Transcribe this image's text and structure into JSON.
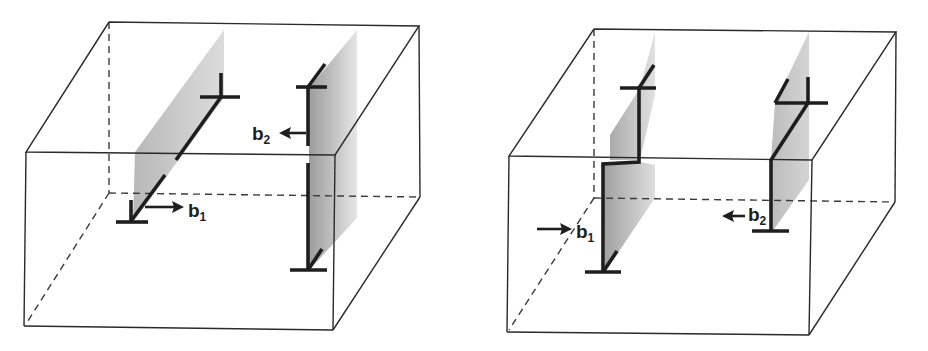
{
  "figure": {
    "colors": {
      "edge": "#2a2a2a",
      "dislocation": "#1e1e1e",
      "slip_plane_dark": "#9a9a9a",
      "slip_plane_light": "#e8e8e8",
      "background": "#ffffff"
    },
    "panels": [
      {
        "id": "left",
        "labels": [
          {
            "text": "b",
            "sub": "1",
            "x": 188,
            "y": 201
          },
          {
            "text": "b",
            "sub": "2",
            "x": 252,
            "y": 124
          }
        ]
      },
      {
        "id": "right",
        "labels": [
          {
            "text": "b",
            "sub": "1",
            "x": 572,
            "y": 222
          },
          {
            "text": "b",
            "sub": "2",
            "x": 748,
            "y": 202
          }
        ]
      }
    ]
  }
}
